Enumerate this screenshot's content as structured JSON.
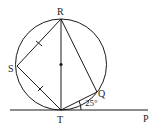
{
  "diagram": {
    "type": "geometry-circle-tangent",
    "circle": {
      "cx": 61,
      "cy": 64.5,
      "r": 45.5
    },
    "points": {
      "R": {
        "label": "R",
        "x": 61,
        "y": 19
      },
      "S": {
        "label": "S",
        "x": 17,
        "y": 66
      },
      "T": {
        "label": "T",
        "x": 61,
        "y": 110
      },
      "Q": {
        "label": "Q",
        "x": 97,
        "y": 92
      },
      "P": {
        "label": "P",
        "x": 150,
        "y": 110
      }
    },
    "center_dot": {
      "x": 61,
      "y": 64.5
    },
    "angle_label": "25°",
    "segments": [
      "RS",
      "ST",
      "RT",
      "RQ",
      "TQ",
      "TP (tangent)"
    ],
    "equal_marks": [
      "RS",
      "ST"
    ],
    "colors": {
      "stroke": "#1a1a1a",
      "background": "#ffffff"
    }
  }
}
